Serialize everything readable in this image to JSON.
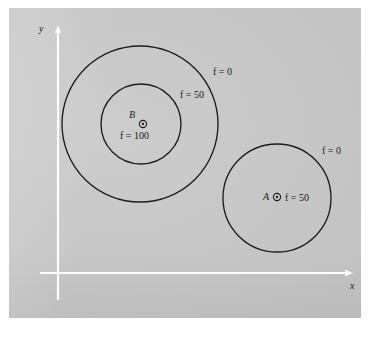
{
  "figure": {
    "title": "",
    "background_color": "#ffffff",
    "panel_color": "#c9c9c9",
    "line_color": "#1b1b1b",
    "axis_color": "#ffffff"
  },
  "axes": {
    "x_label": "x",
    "y_label": "y"
  },
  "chart_data": {
    "type": "scatter",
    "title": "",
    "xlabel": "x",
    "ylabel": "y",
    "grid": false,
    "legend": "none",
    "points": [
      {
        "name": "B",
        "label": "B",
        "value_label": "f = 100",
        "f": 100,
        "cx": 143,
        "cy": 124
      },
      {
        "name": "A",
        "label": "A",
        "value_label": "f = 50",
        "f": 50,
        "cx": 277,
        "cy": 197
      }
    ],
    "contours": [
      {
        "source": "B",
        "label": "f = 0",
        "f": 0,
        "cx": 140,
        "cy": 124,
        "r": 78,
        "label_x": 213,
        "label_y": 67
      },
      {
        "source": "B",
        "label": "f = 50",
        "f": 50,
        "cx": 141,
        "cy": 124,
        "r": 40,
        "label_x": 180,
        "label_y": 90
      },
      {
        "source": "A",
        "label": "f = 0",
        "f": 0,
        "cx": 277,
        "cy": 198,
        "r": 54,
        "label_x": 322,
        "label_y": 146
      }
    ]
  },
  "labels": {
    "outer_b_contour": "f = 0",
    "inner_b_contour": "f = 50",
    "a_contour": "f = 0",
    "b_point": "B",
    "b_value": "f = 100",
    "a_point": "A",
    "a_value": "f = 50"
  }
}
